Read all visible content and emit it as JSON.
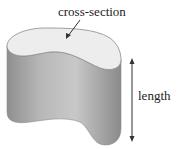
{
  "diagram": {
    "labels": {
      "cross_section": "cross-section",
      "length": "length"
    },
    "colors": {
      "face": "#ededed",
      "side_light": "#c4c4c4",
      "side_dark": "#8a8a8a",
      "outline": "#777777",
      "arrow": "#333333"
    }
  }
}
